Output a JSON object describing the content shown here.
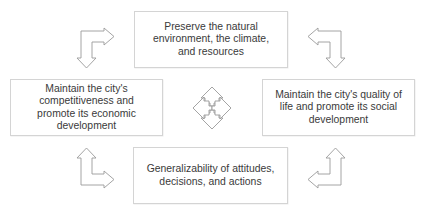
{
  "diagram": {
    "type": "cycle-of-four-goals",
    "boxes": {
      "top": {
        "lines": [
          "Preserve the natural",
          "environment, the climate,",
          "and resources"
        ]
      },
      "left": {
        "lines": [
          "Maintain the city's",
          "competitiveness and",
          "promote its economic",
          "development"
        ]
      },
      "right": {
        "lines": [
          "Maintain the city's quality of",
          "life and promote its social",
          "development"
        ]
      },
      "bottom": {
        "lines": [
          "Generalizability of attitudes,",
          "decisions, and actions"
        ]
      }
    },
    "connectors": [
      {
        "name": "top-left-bent-arrow",
        "from": "left",
        "to": "top",
        "icon": "bent-double-arrow"
      },
      {
        "name": "top-right-bent-arrow",
        "from": "top",
        "to": "right",
        "icon": "bent-double-arrow"
      },
      {
        "name": "bottom-left-bent-arrow",
        "from": "left",
        "to": "bottom",
        "icon": "bent-double-arrow"
      },
      {
        "name": "bottom-right-bent-arrow",
        "from": "bottom",
        "to": "right",
        "icon": "bent-double-arrow"
      }
    ],
    "center_icon": "four-way-arrow",
    "colors": {
      "text": "#3a3a3a",
      "box_border": "#d4d4d4",
      "arrow_stroke": "#9a9a9a",
      "background": "#ffffff"
    }
  }
}
